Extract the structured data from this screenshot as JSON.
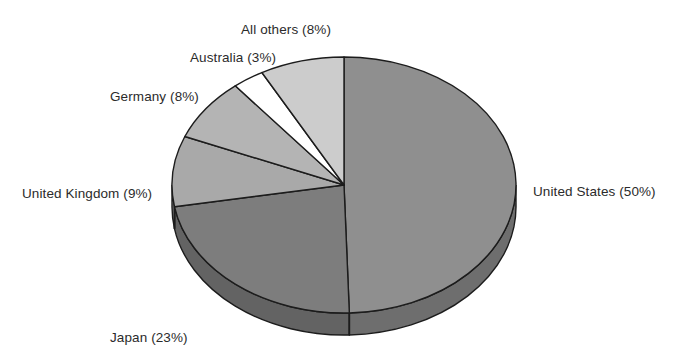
{
  "chart_data": {
    "type": "pie",
    "title": "",
    "subtitle": "",
    "xlabel": "",
    "ylabel": "",
    "legend_position": "none",
    "style": "3d-pie",
    "start_angle_deg": 0,
    "direction": "clockwise",
    "labels": [
      "United States (50%)",
      "Japan (23%)",
      "United Kingdom (9%)",
      "Germany (8%)",
      "Australia (3%)",
      "All others (8%)"
    ],
    "categories": [
      "United States",
      "Japan",
      "United Kingdom",
      "Germany",
      "Australia",
      "All others"
    ],
    "values": [
      50,
      23,
      9,
      8,
      3,
      8
    ],
    "units": "percent",
    "colors": [
      "#8f8f8f",
      "#7d7d7d",
      "#a9a9a9",
      "#b4b4b4",
      "#ffffff",
      "#cccccc"
    ],
    "side_colors": [
      "#6e6e6e",
      "#636363",
      "#878787",
      "#8f8f8f",
      "#d4d4d4",
      "#a6a6a6"
    ],
    "slices": [
      {
        "name": "United States",
        "value": 50,
        "label": "United States (50%)",
        "color": "#8f8f8f"
      },
      {
        "name": "Japan",
        "value": 23,
        "label": "Japan (23%)",
        "color": "#7d7d7d"
      },
      {
        "name": "United Kingdom",
        "value": 9,
        "label": "United Kingdom (9%)",
        "color": "#a9a9a9"
      },
      {
        "name": "Germany",
        "value": 8,
        "label": "Germany (8%)",
        "color": "#b4b4b4"
      },
      {
        "name": "Australia",
        "value": 3,
        "label": "Australia (3%)",
        "color": "#ffffff"
      },
      {
        "name": "All others",
        "value": 8,
        "label": "All others (8%)",
        "color": "#cccccc"
      }
    ],
    "outline_color": "#1c1c1c",
    "background": "#ffffff"
  },
  "geometry": {
    "cx": 344,
    "cy": 185,
    "rx": 172,
    "ry": 128,
    "depth": 22
  }
}
